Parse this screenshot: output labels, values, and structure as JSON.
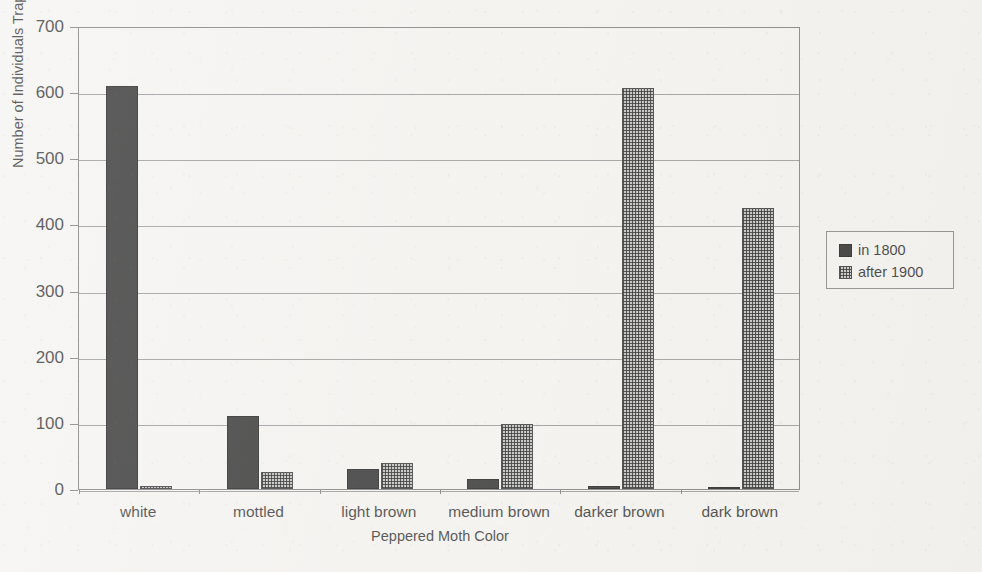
{
  "chart_data": {
    "type": "bar",
    "title": "",
    "xlabel": "Peppered Moth Color",
    "ylabel": "Number of Individuals Trapped",
    "categories": [
      "white",
      "mottled",
      "light brown",
      "medium brown",
      "darker brown",
      "dark brown"
    ],
    "series": [
      {
        "name": "in 1800",
        "values": [
          610,
          110,
          30,
          15,
          5,
          2
        ],
        "style": "solid-black"
      },
      {
        "name": "after 1900",
        "values": [
          5,
          25,
          40,
          98,
          607,
          425
        ],
        "style": "dotted-gray"
      }
    ],
    "ylim": [
      0,
      700
    ],
    "yticks": [
      0,
      100,
      200,
      300,
      400,
      500,
      600,
      700
    ],
    "ytick_labels": [
      "0",
      "100",
      "200",
      "300",
      "400",
      "500",
      "600",
      "700"
    ],
    "grid": true,
    "grid_axis": "y",
    "legend": {
      "position": "right",
      "entries": [
        "in 1800",
        "after 1900"
      ]
    }
  },
  "legend": {
    "entries": [
      {
        "label": "in 1800",
        "swatch": "solid-black-swatch"
      },
      {
        "label": "after 1900",
        "swatch": "dotted-gray-swatch"
      }
    ]
  },
  "colors": {
    "background": "#f4f3f0",
    "series_1": "#151515",
    "series_2": "#b9b9b9",
    "axis": "#6e6e6e",
    "gridline": "#8d8d8d",
    "text": "#1b1b1b"
  }
}
